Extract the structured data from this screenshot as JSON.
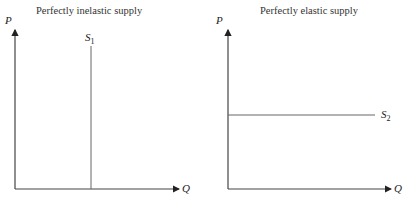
{
  "panels": [
    {
      "title": "Perfectly inelastic supply",
      "y_axis_label": "P",
      "x_axis_label": "Q",
      "curve_label": "S",
      "curve_subscript": "1",
      "curve_type": "vertical"
    },
    {
      "title": "Perfectly elastic supply",
      "y_axis_label": "P",
      "x_axis_label": "Q",
      "curve_label": "S",
      "curve_subscript": "2",
      "curve_type": "horizontal"
    }
  ],
  "colors": {
    "axis": "#333333",
    "curve": "#555555",
    "text": "#222222"
  }
}
